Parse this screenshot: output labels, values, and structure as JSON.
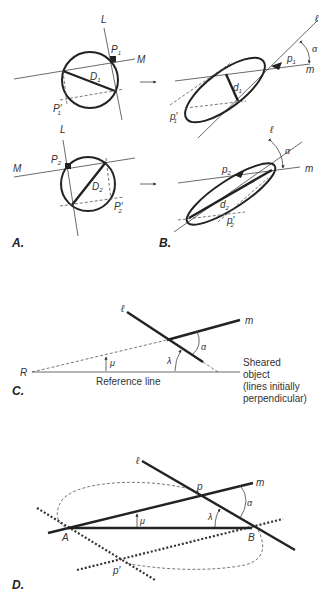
{
  "figure": {
    "panels": {
      "A": {
        "label": "A.",
        "top": {
          "line_L": "L",
          "line_M": "M",
          "point_P": "P",
          "point_P_sub": "1",
          "diameter": "D",
          "diameter_sub": "1",
          "point_Pprime": "P′",
          "point_Pprime_sub": "1"
        },
        "bottom": {
          "line_L": "L",
          "line_M": "M",
          "point_P": "P",
          "point_P_sub": "2",
          "diameter": "D",
          "diameter_sub": "2",
          "point_Pprime": "P′",
          "point_Pprime_sub": "2"
        }
      },
      "B": {
        "label": "B.",
        "top": {
          "line_l": "ℓ",
          "line_m": "m",
          "point_p": "p",
          "point_p_sub": "1",
          "diameter": "d",
          "diameter_sub": "1",
          "point_pprime": "p′",
          "point_pprime_sub": "1",
          "angle": "α"
        },
        "bottom": {
          "line_l": "ℓ",
          "line_m": "m",
          "point_p": "p",
          "point_p_sub": "2",
          "diameter": "d",
          "diameter_sub": "2",
          "point_pprime": "p′",
          "point_pprime_sub": "2",
          "angle": "α"
        }
      },
      "C": {
        "label": "C.",
        "line_l": "ℓ",
        "line_m": "m",
        "point_R": "R",
        "angle_alpha": "α",
        "angle_mu": "μ",
        "angle_lambda": "λ",
        "reference_line": "Reference line",
        "caption_lines": [
          "Sheared",
          "object",
          "(lines initially",
          "perpendicular)"
        ]
      },
      "D": {
        "label": "D.",
        "line_l": "ℓ",
        "line_m": "m",
        "point_p": "p",
        "point_pprime": "p′",
        "point_A": "A",
        "point_B": "B",
        "angle_alpha": "α",
        "angle_mu": "μ",
        "angle_lambda": "λ"
      }
    },
    "arrow_glyph": "→"
  }
}
